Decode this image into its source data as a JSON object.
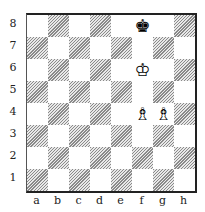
{
  "diagram": {
    "ranks": [
      "8",
      "7",
      "6",
      "5",
      "4",
      "3",
      "2",
      "1"
    ],
    "files": [
      "a",
      "b",
      "c",
      "d",
      "e",
      "f",
      "g",
      "h"
    ],
    "colors": {
      "dark_square": "#8a8a8a",
      "light_square": "#ffffff",
      "border": "#222222"
    },
    "pieces": [
      {
        "square": "f8",
        "color": "black",
        "type": "king",
        "glyph": "♚"
      },
      {
        "square": "f6",
        "color": "white",
        "type": "king",
        "glyph": "♔"
      },
      {
        "square": "f4",
        "color": "white",
        "type": "bishop",
        "glyph": "♗"
      },
      {
        "square": "g4",
        "color": "white",
        "type": "bishop",
        "glyph": "♗"
      }
    ]
  }
}
